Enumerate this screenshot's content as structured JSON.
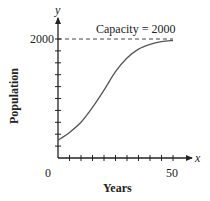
{
  "chart_data": {
    "type": "line",
    "title": "",
    "xlabel": "Years",
    "ylabel": "Population",
    "x_axis_letter": "x",
    "y_axis_letter": "y",
    "xlim": [
      0,
      50
    ],
    "ylim": [
      0,
      2000
    ],
    "x_tick_labels": [
      "0",
      "50"
    ],
    "y_tick_labels": [
      "2000"
    ],
    "x_tick_count": 10,
    "y_tick_count": 10,
    "grid": false,
    "legend": null,
    "annotations": [
      {
        "text": "Capacity = 2000",
        "type": "horizontal-dashed-line",
        "y": 2000
      }
    ],
    "series": [
      {
        "name": "Population",
        "x": [
          0,
          5,
          10,
          15,
          20,
          25,
          30,
          35,
          40,
          45,
          50
        ],
        "y": [
          300,
          430,
          600,
          850,
          1140,
          1450,
          1680,
          1830,
          1910,
          1955,
          1975
        ]
      }
    ]
  },
  "labels": {
    "y_letter": "y",
    "x_letter": "x",
    "y_top": "2000",
    "x_zero": "0",
    "x_end": "50",
    "capacity": "Capacity = 2000",
    "x_title": "Years",
    "y_title": "Population"
  },
  "colors": {
    "axis": "#222222",
    "curve": "#555555",
    "dash": "#444444"
  }
}
